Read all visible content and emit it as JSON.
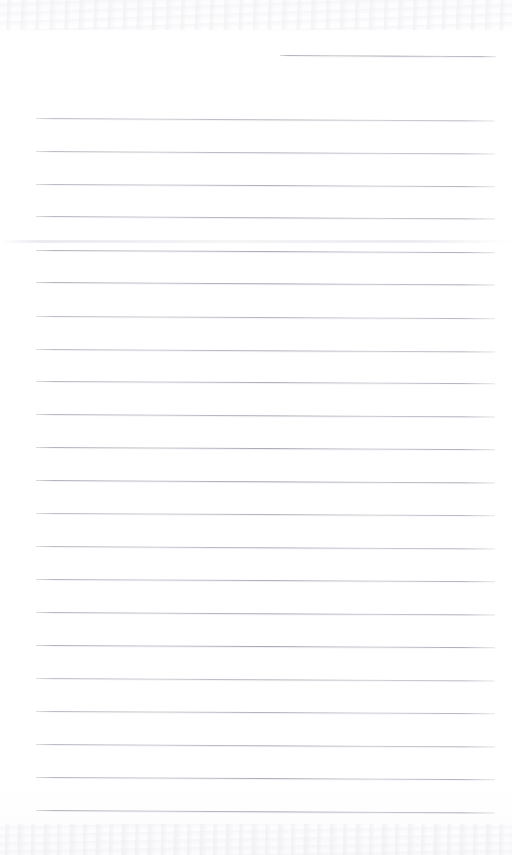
{
  "document": {
    "kind": "scanned-ruled-notebook-page",
    "title": "Blank Lined Notebook Page",
    "page_width": 512,
    "page_height": 855,
    "background_color": "#fefeff",
    "rule_color": "#a0a0ac",
    "content_text": "",
    "handwriting_present": "no",
    "printed_text_present": "no"
  },
  "layout": {
    "left_margin_px": 36,
    "right_margin_px": 17,
    "rule_left_x": 36,
    "rule_right_x": 495,
    "rule_spacing_px": 32.5,
    "rule_tilt_deg": 0.28,
    "first_full_rule_y": 118,
    "last_rule_y": 810,
    "rule_count": 23
  },
  "partial_rule": {
    "label": "short top rule",
    "x": 280,
    "y": 55,
    "width": 216,
    "tilt_deg": 0.3
  },
  "rules": [
    {
      "y": 118,
      "x": 36,
      "width": 459,
      "tilt": 0.3
    },
    {
      "y": 151,
      "x": 36,
      "width": 459,
      "tilt": 0.3
    },
    {
      "y": 184,
      "x": 36,
      "width": 459,
      "tilt": 0.28
    },
    {
      "y": 216,
      "x": 36,
      "width": 459,
      "tilt": 0.3
    },
    {
      "y": 250,
      "x": 36,
      "width": 459,
      "tilt": 0.28
    },
    {
      "y": 282,
      "x": 36,
      "width": 459,
      "tilt": 0.3
    },
    {
      "y": 316,
      "x": 36,
      "width": 459,
      "tilt": 0.28
    },
    {
      "y": 349,
      "x": 36,
      "width": 459,
      "tilt": 0.3
    },
    {
      "y": 381,
      "x": 36,
      "width": 459,
      "tilt": 0.28
    },
    {
      "y": 414,
      "x": 36,
      "width": 459,
      "tilt": 0.3
    },
    {
      "y": 447,
      "x": 36,
      "width": 459,
      "tilt": 0.28
    },
    {
      "y": 480,
      "x": 36,
      "width": 459,
      "tilt": 0.3
    },
    {
      "y": 513,
      "x": 36,
      "width": 459,
      "tilt": 0.28
    },
    {
      "y": 546,
      "x": 36,
      "width": 459,
      "tilt": 0.3
    },
    {
      "y": 579,
      "x": 36,
      "width": 459,
      "tilt": 0.28
    },
    {
      "y": 612,
      "x": 36,
      "width": 459,
      "tilt": 0.3
    },
    {
      "y": 645,
      "x": 36,
      "width": 459,
      "tilt": 0.28
    },
    {
      "y": 678,
      "x": 36,
      "width": 459,
      "tilt": 0.3
    },
    {
      "y": 711,
      "x": 36,
      "width": 459,
      "tilt": 0.28
    },
    {
      "y": 744,
      "x": 36,
      "width": 459,
      "tilt": 0.3
    },
    {
      "y": 777,
      "x": 36,
      "width": 459,
      "tilt": 0.28
    },
    {
      "y": 810,
      "x": 36,
      "width": 459,
      "tilt": 0.3
    }
  ],
  "artifacts": {
    "fold_band_y": 240,
    "top_noise_band": {
      "y": 0,
      "height": 30
    },
    "bottom_noise_band": {
      "y": 824,
      "height": 31
    }
  }
}
